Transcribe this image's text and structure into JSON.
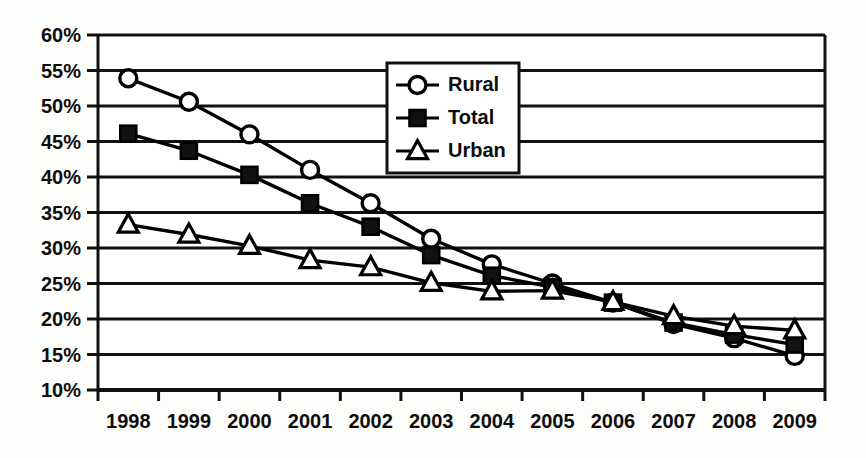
{
  "chart_data": {
    "type": "line",
    "title": "",
    "subtitle": "",
    "xlabel": "",
    "ylabel": "",
    "categories": [
      "1998",
      "1999",
      "2000",
      "2001",
      "2002",
      "2003",
      "2004",
      "2005",
      "2006",
      "2007",
      "2008",
      "2009"
    ],
    "ylim": [
      10,
      60
    ],
    "ytick_step": 5,
    "ytick_labels": [
      "60%",
      "55%",
      "50%",
      "45%",
      "40%",
      "35%",
      "30%",
      "25%",
      "20%",
      "15%",
      "10%"
    ],
    "ytick_values": [
      60,
      55,
      50,
      45,
      40,
      35,
      30,
      25,
      20,
      15,
      10
    ],
    "grid": "horizontal",
    "grid_on": true,
    "legend_position": "top-center",
    "value_suffix": "%",
    "series": [
      {
        "name": "Rural",
        "marker": "open-circle",
        "color": "#000000",
        "values": [
          53.9,
          50.6,
          46.0,
          41.0,
          36.3,
          31.3,
          27.7,
          25.0,
          22.3,
          19.3,
          17.3,
          14.8
        ]
      },
      {
        "name": "Total",
        "marker": "filled-square",
        "color": "#000000",
        "values": [
          46.1,
          43.7,
          40.3,
          36.3,
          33.0,
          29.0,
          26.1,
          24.5,
          22.3,
          19.5,
          17.8,
          16.4
        ]
      },
      {
        "name": "Urban",
        "marker": "open-triangle",
        "color": "#000000",
        "values": [
          33.3,
          31.9,
          30.3,
          28.3,
          27.3,
          25.1,
          23.9,
          24.0,
          22.4,
          20.4,
          19.0,
          18.4
        ]
      }
    ]
  },
  "axis": {
    "y_labels": [
      "60%",
      "55%",
      "50%",
      "45%",
      "40%",
      "35%",
      "30%",
      "25%",
      "20%",
      "15%",
      "10%"
    ],
    "x_labels": [
      "1998",
      "1999",
      "2000",
      "2001",
      "2002",
      "2003",
      "2004",
      "2005",
      "2006",
      "2007",
      "2008",
      "2009"
    ]
  },
  "legend": {
    "entries": [
      {
        "label": "Rural",
        "marker": "open-circle"
      },
      {
        "label": "Total",
        "marker": "filled-square"
      },
      {
        "label": "Urban",
        "marker": "open-triangle"
      }
    ]
  }
}
